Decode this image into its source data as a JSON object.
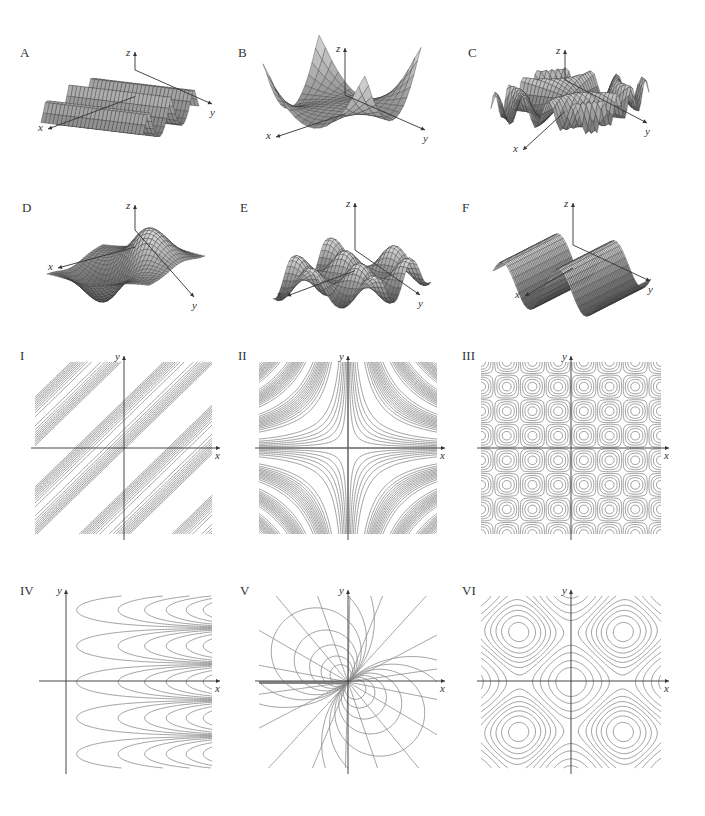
{
  "page": {
    "line_color": "#888888",
    "axis_color": "#333333",
    "surface_fill": "#bdbdbd",
    "surface_mesh": "#333333"
  },
  "surfaces": [
    {
      "label": "A",
      "axes": {
        "x": "x",
        "y": "y",
        "z": "z"
      },
      "shape": "periodic ridges in x, cusped"
    },
    {
      "label": "B",
      "axes": {
        "x": "x",
        "y": "y",
        "z": "z"
      },
      "shape": "saddle-like bowl with raised corners"
    },
    {
      "label": "C",
      "axes": {
        "x": "x",
        "y": "y",
        "z": "z"
      },
      "shape": "rapidly oscillating ruffled surface"
    },
    {
      "label": "D",
      "axes": {
        "x": "x",
        "y": "y",
        "z": "z"
      },
      "shape": "dipole hump and trough"
    },
    {
      "label": "E",
      "axes": {
        "x": "x",
        "y": "y",
        "z": "z"
      },
      "shape": "egg-crate sin x sin y"
    },
    {
      "label": "F",
      "axes": {
        "x": "x",
        "y": "y",
        "z": "z"
      },
      "shape": "waves sin in x, dense mesh"
    }
  ],
  "contours": [
    {
      "label": "I",
      "axes": {
        "x": "x",
        "y": "y"
      },
      "pattern": "diagonal bands of parallel lines"
    },
    {
      "label": "II",
      "axes": {
        "x": "x",
        "y": "y"
      },
      "pattern": "hyperbolas xy = c, bunched in bands"
    },
    {
      "label": "III",
      "axes": {
        "x": "x",
        "y": "y"
      },
      "pattern": "checkerboard of nested rounded circles"
    },
    {
      "label": "IV",
      "axes": {
        "x": "x",
        "y": "y"
      },
      "pattern": "horizontal parabolas opening left, periodic in y"
    },
    {
      "label": "V",
      "axes": {
        "x": "x",
        "y": "y"
      },
      "pattern": "dipole circles through origin plus radial lines"
    },
    {
      "label": "VI",
      "axes": {
        "x": "x",
        "y": "y"
      },
      "pattern": "central closed loop with saddle-shaped outer curves"
    }
  ]
}
